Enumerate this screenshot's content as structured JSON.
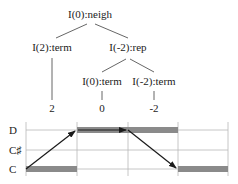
{
  "tree": {
    "root": {
      "label": "I(0):neigh"
    },
    "level1": [
      {
        "label": "I(2):term"
      },
      {
        "label": "I(-2):rep"
      }
    ],
    "level2": [
      {
        "label": "I(0):term"
      },
      {
        "label": "I(-2):term"
      }
    ],
    "leaves": [
      {
        "label": "2"
      },
      {
        "label": "0"
      },
      {
        "label": "-2"
      }
    ]
  },
  "pitch_chart": {
    "y_labels": [
      "D",
      "C♯",
      "C"
    ],
    "segments": [
      {
        "pitch": "C",
        "index": 0
      },
      {
        "pitch": "D",
        "index": 1
      },
      {
        "pitch": "D",
        "index": 2
      },
      {
        "pitch": "C",
        "index": 3
      }
    ],
    "arrows": [
      {
        "from": "C",
        "to": "D"
      },
      {
        "from": "D",
        "to": "D"
      },
      {
        "from": "D",
        "to": "C"
      }
    ],
    "colors": {
      "bar": "#8a8a8a",
      "grid": "#b8b8b8",
      "arrow": "#1a1a1a"
    }
  }
}
